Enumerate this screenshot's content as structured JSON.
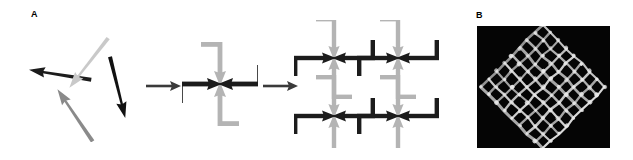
{
  "figure": {
    "panels": [
      {
        "id": "A",
        "label": "A",
        "type": "schematic",
        "description": "Self-assembly schematic: disordered arrow-shaped building blocks assemble into a four-arm pinwheel cross motif, which tiles into a two-dimensional periodic lattice.",
        "stages": [
          {
            "name": "disordered-monomers",
            "label": "",
            "units": [
              {
                "name": "arrow-upper-left-dark",
                "color": "#1c1c1c",
                "angle_deg": 190,
                "tone": "dark"
              },
              {
                "name": "arrow-top-light",
                "color": "#c9c9c9",
                "angle_deg": 215,
                "tone": "light"
              },
              {
                "name": "arrow-right-dark",
                "color": "#121212",
                "angle_deg": 110,
                "tone": "dark"
              },
              {
                "name": "arrow-bottom-gray",
                "color": "#8a8a8a",
                "angle_deg": 305,
                "tone": "gray"
              }
            ]
          },
          {
            "name": "pinwheel-cross-motif",
            "label": "",
            "arms": [
              {
                "name": "arm-west-dark",
                "color": "#1c1c1c",
                "direction": "left"
              },
              {
                "name": "arm-east-dark",
                "color": "#1c1c1c",
                "direction": "right"
              },
              {
                "name": "arm-north-gray",
                "color": "#b4b4b4",
                "direction": "up"
              },
              {
                "name": "arm-south-gray",
                "color": "#b4b4b4",
                "direction": "down"
              }
            ]
          },
          {
            "name": "periodic-lattice",
            "label": "",
            "rows": 2,
            "columns": 2,
            "unit_count": 4
          }
        ],
        "transitions": [
          {
            "name": "transition-arrow-1",
            "glyph": "→",
            "color": "#3a3a3a"
          },
          {
            "name": "transition-arrow-2",
            "glyph": "→",
            "color": "#3a3a3a"
          }
        ]
      },
      {
        "id": "B",
        "label": "B",
        "type": "micrograph",
        "description": "Atomic force microscopy image of the assembled two-dimensional lattice, bright filaments forming a square mesh on a dark background, tilted approximately 45 degrees.",
        "background_color": "#050505",
        "filament_color": "#e8e8e8",
        "mesh": {
          "rows": 8,
          "columns": 8,
          "rotation_deg": 45
        }
      }
    ],
    "colors": {
      "dark_unit": "#1c1c1c",
      "light_unit": "#c9c9c9",
      "gray_unit": "#8a8a8a",
      "lattice_dark": "#1c1c1c",
      "lattice_gray": "#b4b4b4",
      "arrow_transition": "#3a3a3a",
      "panel_background": "#ffffff",
      "micrograph_background": "#050505"
    }
  }
}
